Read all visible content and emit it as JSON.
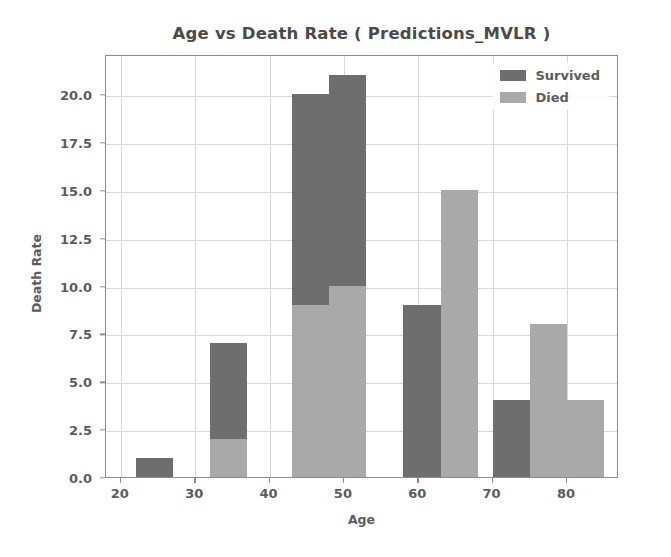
{
  "chart_data": {
    "type": "bar",
    "title": "Age vs Death Rate ( Predictions_MVLR )",
    "xlabel": "Age",
    "ylabel": "Death Rate",
    "xlim": [
      18,
      87
    ],
    "ylim": [
      0,
      22.1
    ],
    "grid": true,
    "legend_position": "upper right",
    "xticks": [
      "20",
      "30",
      "40",
      "50",
      "60",
      "70",
      "80"
    ],
    "xtick_values": [
      20,
      30,
      40,
      50,
      60,
      70,
      80
    ],
    "yticks": [
      "0.0",
      "2.5",
      "5.0",
      "7.5",
      "10.0",
      "12.5",
      "15.0",
      "17.5",
      "20.0"
    ],
    "ytick_values": [
      0.0,
      2.5,
      5.0,
      7.5,
      10.0,
      12.5,
      15.0,
      17.5,
      20.0
    ],
    "colors": {
      "survived": "#6e6e6e",
      "died": "#a9a9a9",
      "grid": "#d7d7d7",
      "axis": "#8c8c8c",
      "text": "#5c5c5c",
      "background": "#ffffff"
    },
    "series": [
      {
        "name": "Survived",
        "color": "#6e6e6e",
        "bars": [
          {
            "x0": 22,
            "x1": 27,
            "value": 1
          },
          {
            "x0": 32,
            "x1": 37,
            "value": 7
          },
          {
            "x0": 43,
            "x1": 48,
            "value": 20
          },
          {
            "x0": 48,
            "x1": 53,
            "value": 21
          },
          {
            "x0": 58,
            "x1": 63,
            "value": 9
          },
          {
            "x0": 70,
            "x1": 75,
            "value": 4
          }
        ]
      },
      {
        "name": "Died",
        "color": "#a9a9a9",
        "bars": [
          {
            "x0": 32,
            "x1": 37,
            "value": 2
          },
          {
            "x0": 43,
            "x1": 48,
            "value": 9
          },
          {
            "x0": 48,
            "x1": 53,
            "value": 10
          },
          {
            "x0": 63,
            "x1": 68,
            "value": 15
          },
          {
            "x0": 75,
            "x1": 80,
            "value": 8
          },
          {
            "x0": 80,
            "x1": 85,
            "value": 4
          }
        ]
      }
    ],
    "legend_entries": [
      {
        "label": "Survived",
        "color": "#6e6e6e"
      },
      {
        "label": "Died",
        "color": "#a9a9a9"
      }
    ]
  }
}
